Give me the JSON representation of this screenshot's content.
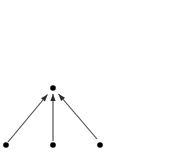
{
  "canvas": {
    "width": 184,
    "height": 161,
    "background": "#ffffff"
  },
  "chart_data": {
    "type": "diagram",
    "title": "",
    "subtitle": "",
    "xlabel": "",
    "ylabel": "",
    "grid": false,
    "legend": null,
    "annotations": [],
    "node_color": "#000000",
    "edge_color": "#4a4a4a",
    "arrowhead_color": "#2b2b2b",
    "node_radius": 2.8,
    "xlim": [
      0,
      184
    ],
    "ylim": [
      0,
      161
    ],
    "nodes": [
      {
        "id": "apex",
        "label": "",
        "x": 53,
        "y": 88
      },
      {
        "id": "left",
        "label": "",
        "x": 6,
        "y": 145
      },
      {
        "id": "middle",
        "label": "",
        "x": 53,
        "y": 145
      },
      {
        "id": "right",
        "label": "",
        "x": 100,
        "y": 145
      }
    ],
    "edges": [
      {
        "id": "edge-left-to-apex",
        "source": "left",
        "target": "apex",
        "directed": true,
        "label": "",
        "x1": 8,
        "y1": 142,
        "x2": 47.5,
        "y2": 94.5
      },
      {
        "id": "edge-middle-to-apex",
        "source": "middle",
        "target": "apex",
        "directed": true,
        "label": "",
        "x1": 53,
        "y1": 141,
        "x2": 53,
        "y2": 94
      },
      {
        "id": "edge-right-to-apex",
        "source": "right",
        "target": "apex",
        "directed": true,
        "label": "",
        "x1": 97,
        "y1": 139,
        "x2": 58.5,
        "y2": 94
      }
    ]
  }
}
